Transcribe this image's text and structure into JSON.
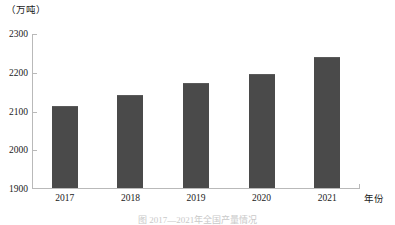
{
  "chart_data": {
    "type": "bar",
    "title": "",
    "subtitle": "",
    "unit_label": "（万吨）",
    "xlabel": "年份",
    "ylabel": "",
    "categories": [
      "2017",
      "2018",
      "2019",
      "2020",
      "2021"
    ],
    "values": [
      2112,
      2140,
      2170,
      2195,
      2238
    ],
    "ylim": [
      1900,
      2300
    ],
    "yticks": [
      2300,
      2200,
      2100,
      2000,
      1900
    ],
    "ytick_labels": [
      "2300",
      "2200",
      "2100",
      "2000",
      "1900"
    ],
    "grid": false,
    "legend": null,
    "legend_position": "none",
    "series": [
      {
        "name": "产量",
        "values": [
          2112,
          2140,
          2170,
          2195,
          2238
        ]
      }
    ],
    "bar_color": "#4a4a4a",
    "axis_color": "#b9b9b9",
    "text_color": "#1a1a1a"
  },
  "caption": {
    "text": "图  2017—2021年全国产量情况"
  }
}
